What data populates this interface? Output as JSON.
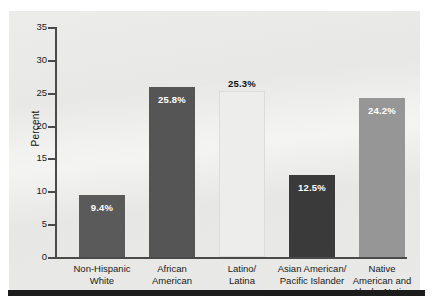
{
  "chart_data": {
    "type": "bar",
    "title": "",
    "xlabel": "",
    "ylabel": "Percent",
    "ylim": [
      0,
      35
    ],
    "ytick_step": 5,
    "grid": false,
    "legend": "none",
    "categories": [
      "Non-Hispanic\nWhite",
      "African\nAmerican",
      "Latino/\nLatina",
      "Asian American/\nPacific Islander",
      "Native\nAmerican and\nAlaska Native"
    ],
    "values": [
      9.4,
      25.8,
      25.3,
      12.5,
      24.2
    ],
    "value_labels": [
      "9.4%",
      "25.8%",
      "25.3%",
      "12.5%",
      "24.2%"
    ],
    "y_tick_labels": [
      "35",
      "30",
      "25",
      "20",
      "15",
      "10",
      "5",
      "0"
    ],
    "bars": [
      {
        "category_line1": "Non-Hispanic",
        "category_line2": "White",
        "category_line3": "",
        "value": 9.4,
        "label": "9.4%",
        "color": "#5a5a5a",
        "label_placement": "inside",
        "label_color": "#ffffff"
      },
      {
        "category_line1": "African",
        "category_line2": "American",
        "category_line3": "",
        "value": 25.8,
        "label": "25.8%",
        "color": "#555555",
        "label_placement": "inside",
        "label_color": "#ffffff"
      },
      {
        "category_line1": "Latino/",
        "category_line2": "Latina",
        "category_line3": "",
        "value": 25.3,
        "label": "25.3%",
        "color": "#ededeb",
        "label_placement": "outside",
        "label_color": "#111111"
      },
      {
        "category_line1": "Asian American/",
        "category_line2": "Pacific Islander",
        "category_line3": "",
        "value": 12.5,
        "label": "12.5%",
        "color": "#3a3a3a",
        "label_placement": "inside",
        "label_color": "#ffffff"
      },
      {
        "category_line1": "Native",
        "category_line2": "American and",
        "category_line3": "Alaska Native",
        "value": 24.2,
        "label": "24.2%",
        "color": "#969696",
        "label_placement": "inside",
        "label_color": "#ffffff"
      }
    ]
  },
  "colors": {
    "panel_background": "#e8e8e6",
    "axis": "#4a4a4a",
    "text": "#1a1a1a",
    "rule": "#1c1c1c"
  }
}
